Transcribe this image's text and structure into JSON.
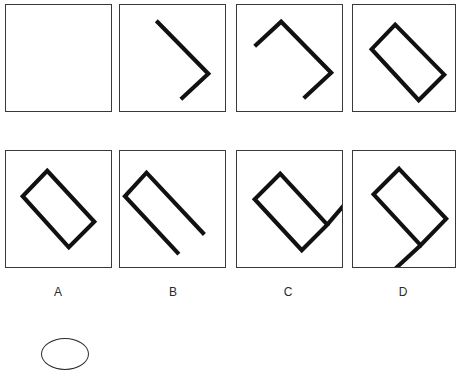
{
  "item": {
    "type": "figural-series-reasoning",
    "stroke_color": "#111111",
    "panel_border_color": "#3a3a3a",
    "background_color": "#ffffff",
    "stroke_width": 4.2
  },
  "sequence": {
    "name": "stimulus-row",
    "panels": [
      {
        "id": "stimulus-1",
        "description": "empty square",
        "segment_count": 0,
        "paths": []
      },
      {
        "id": "stimulus-2",
        "description": "two-segment chevron pointing right",
        "segment_count": 2,
        "paths": [
          "M 37 16 L 90 70 L 62 96"
        ]
      },
      {
        "id": "stimulus-3",
        "description": "three-segment open figure, apex at top",
        "segment_count": 3,
        "paths": [
          "M 18 42 L 45 17 L 96 69 L 68 95"
        ]
      },
      {
        "id": "stimulus-4",
        "description": "closed tilted rectangle, four segments",
        "segment_count": 4,
        "paths": [
          "M 43 20 L 93 71 L 67 97 L 19 45 Z"
        ]
      }
    ]
  },
  "options": {
    "name": "answer-options-row",
    "items": [
      {
        "id": "option-a",
        "label": "A",
        "description": "closed tilted rectangle leaning right-down",
        "segment_count": 4,
        "paths": [
          "M 42 20 L 90 72 L 64 98 L 17 46 Z"
        ]
      },
      {
        "id": "option-b",
        "label": "B",
        "description": "three-segment open figure with two long legs",
        "segment_count": 3,
        "paths": [
          "M 86 85 L 27 22 L 5 46 L 60 105"
        ]
      },
      {
        "id": "option-c",
        "label": "C",
        "description": "closed rectangle with tail extending up-right",
        "segment_count": 5,
        "paths": [
          "M 44 23 L 92 75 L 66 101 L 18 49 Z",
          "M 92 75 L 115 48"
        ]
      },
      {
        "id": "option-d",
        "label": "D",
        "description": "closed rectangle with tail extending down-left",
        "segment_count": 5,
        "paths": [
          "M 47 18 L 95 69 L 69 96 L 21 44 Z",
          "M 69 96 L 43 120"
        ]
      }
    ]
  },
  "answer_bubble": {
    "name": "answer-bubble",
    "shape": "ellipse",
    "filled": false
  }
}
